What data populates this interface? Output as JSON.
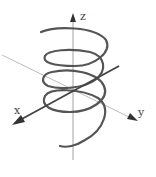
{
  "diagram": {
    "title": "",
    "axes": {
      "x_label": "x",
      "y_label": "y",
      "z_label": "z"
    },
    "colors": {
      "helix": "#555555",
      "axis_thick": "#444444",
      "axis_thin": "#999999",
      "background": "#ffffff"
    }
  }
}
